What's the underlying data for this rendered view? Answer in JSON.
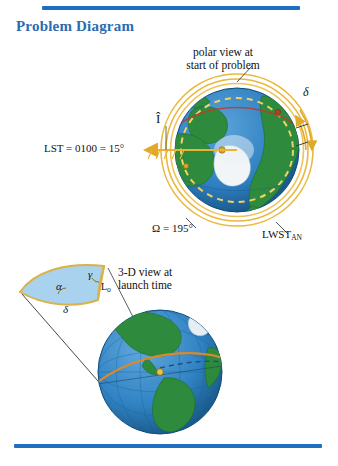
{
  "page": {
    "title": "Problem Diagram",
    "title_color": "#2b6cb0",
    "rule_color": "#1f6fc0",
    "background": "#ffffff"
  },
  "polar_view": {
    "caption_line1": "polar view at",
    "caption_line2": "start of problem",
    "lst_label": "LST = 0100 = 15°",
    "i_hat_label": "Î",
    "raan_label": "Ω = 195°",
    "lwst_label": "LWST",
    "lwst_subscript": "AN",
    "delta_label": "δ"
  },
  "three_d_view": {
    "caption_line1": "3-D view at",
    "caption_line2": "launch time",
    "alpha_label": "α",
    "gamma_label": "γ",
    "delta_label": "δ",
    "lo_label": "L",
    "lo_subscript": "o"
  },
  "colors": {
    "ocean": "#2f7fc1",
    "ocean_deep": "#1d5f9e",
    "land": "#2e8b3d",
    "land_dark": "#1f6b2c",
    "orbit_gold": "#e8b433",
    "orbit_gold_light": "#f2d27a",
    "triangle_fill": "#a9d2ef",
    "triangle_edge": "#d9b24a",
    "ice": "#f2f5f7",
    "track_red": "#c0392b"
  }
}
